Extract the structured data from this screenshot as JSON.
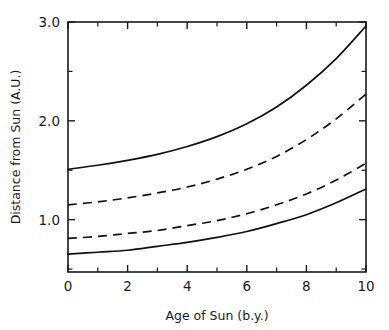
{
  "chart_data": {
    "type": "line",
    "title": "",
    "xlabel": "Age of Sun (b.y.)",
    "ylabel": "Distance from Sun (A.U.)",
    "xlim": [
      0,
      10
    ],
    "ylim": [
      0.47,
      3.0
    ],
    "grid": false,
    "legend": "none",
    "x_ticks_major": [
      "0",
      "2",
      "4",
      "6",
      "8",
      "10"
    ],
    "x_ticks_major_values": [
      0,
      2,
      4,
      6,
      8,
      10
    ],
    "x_ticks_minor_values": [
      1,
      3,
      5,
      7,
      9
    ],
    "y_ticks_major": [
      "1.0",
      "2.0",
      "3.0"
    ],
    "y_ticks_major_values": [
      1.0,
      2.0,
      3.0
    ],
    "y_ticks_minor_values": [
      0.5,
      1.5,
      2.5
    ],
    "x": [
      0,
      1,
      2,
      3,
      4,
      5,
      6,
      7,
      8,
      9,
      10
    ],
    "series": [
      {
        "name": "outer-solid-boundary",
        "style": "solid",
        "values": [
          1.51,
          1.55,
          1.6,
          1.66,
          1.74,
          1.84,
          1.97,
          2.14,
          2.36,
          2.63,
          2.96
        ]
      },
      {
        "name": "outer-dashed-boundary",
        "style": "dashed",
        "values": [
          1.15,
          1.18,
          1.22,
          1.27,
          1.33,
          1.41,
          1.51,
          1.64,
          1.81,
          2.02,
          2.27
        ]
      },
      {
        "name": "inner-dashed-boundary",
        "style": "dashed",
        "values": [
          0.81,
          0.83,
          0.86,
          0.89,
          0.94,
          0.99,
          1.06,
          1.15,
          1.26,
          1.4,
          1.57
        ]
      },
      {
        "name": "inner-solid-boundary",
        "style": "solid",
        "values": [
          0.65,
          0.67,
          0.69,
          0.73,
          0.77,
          0.82,
          0.88,
          0.96,
          1.05,
          1.17,
          1.31
        ]
      }
    ],
    "colors": {
      "axis": "#1a1a1a",
      "curve": "#111111",
      "background": "#ffffff"
    }
  }
}
